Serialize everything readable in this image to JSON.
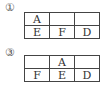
{
  "figures": [
    {
      "label": "①",
      "rows": [
        [
          "A",
          "",
          ""
        ],
        [
          "E",
          "F",
          "D"
        ]
      ]
    },
    {
      "label": "③",
      "rows": [
        [
          "",
          "A",
          ""
        ],
        [
          "F",
          "E",
          "D"
        ]
      ]
    }
  ]
}
